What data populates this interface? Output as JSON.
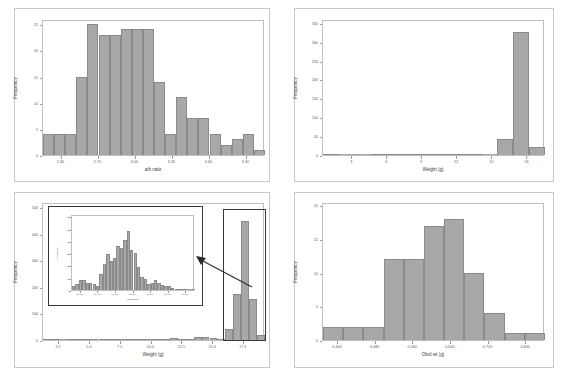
{
  "figure": {
    "background": "#ffffff",
    "bar_fill": "#a8a8a8",
    "bar_edge": "#8a8a8a",
    "frame_color": "#c9c9c9"
  },
  "chart_data": [
    {
      "panel": "top-left",
      "type": "bar",
      "title": "",
      "xlabel": "a/b ratio",
      "ylabel": "Frequency",
      "xlim": [
        2.25,
        4.05
      ],
      "ylim": [
        0,
        26
      ],
      "xticks": [
        "2.40",
        "2.70",
        "3.00",
        "3.30",
        "3.60",
        "3.90"
      ],
      "xtickvals": [
        2.4,
        2.7,
        3.0,
        3.3,
        3.6,
        3.9
      ],
      "yticks": [
        "0",
        "5",
        "10",
        "15",
        "20",
        "25"
      ],
      "ytickvals": [
        0,
        5,
        10,
        15,
        20,
        25
      ],
      "bin_width": 0.09,
      "bin_start": 2.28,
      "values": [
        4,
        4,
        4,
        15,
        25,
        23,
        23,
        24,
        24,
        24,
        14,
        4,
        11,
        7,
        7,
        4,
        2,
        3,
        4,
        1
      ],
      "grid": false,
      "legend": "none"
    },
    {
      "panel": "top-right",
      "type": "bar",
      "title": "",
      "xlabel": "Weight (g)",
      "ylabel": "Frequency",
      "xlim": [
        0.5,
        19.5
      ],
      "ylim": [
        0,
        360
      ],
      "xticks": [
        "3",
        "6",
        "9",
        "12",
        "15",
        "18"
      ],
      "xtickvals": [
        3,
        6,
        9,
        12,
        15,
        18
      ],
      "yticks": [
        "0",
        "50",
        "100",
        "150",
        "200",
        "250",
        "300",
        "350"
      ],
      "ytickvals": [
        0,
        50,
        100,
        150,
        200,
        250,
        300,
        350
      ],
      "bin_width": 1.5,
      "bin_start": 0.75,
      "values": [
        1,
        0,
        0,
        1,
        1,
        1,
        2,
        4,
        1,
        1,
        0,
        43,
        325,
        22
      ],
      "grid": false,
      "legend": "none"
    },
    {
      "panel": "bottom-left",
      "type": "bar",
      "title": "",
      "xlabel": "Weight (g)",
      "ylabel": "Frequency",
      "xlim": [
        1.2,
        19.2
      ],
      "ylim": [
        0,
        520
      ],
      "xticks": [
        "2.5",
        "5.0",
        "7.5",
        "10.0",
        "12.5",
        "15.0",
        "17.5"
      ],
      "xtickvals": [
        2.5,
        5.0,
        7.5,
        10.0,
        12.5,
        15.0,
        17.5
      ],
      "yticks": [
        "0",
        "100",
        "200",
        "300",
        "400",
        "500"
      ],
      "ytickvals": [
        0,
        100,
        200,
        300,
        400,
        500
      ],
      "bin_width": 0.6,
      "bin_start": 1.5,
      "values": [
        2,
        1,
        0,
        1,
        2,
        1,
        1,
        2,
        3,
        4,
        4,
        3,
        3,
        4,
        4,
        5,
        6,
        5,
        4,
        12,
        10,
        6,
        4,
        40,
        175,
        450,
        155,
        20
      ],
      "grid": false,
      "legend": "none",
      "annotation": "inset zoom of peak region",
      "inset": {
        "type": "bar",
        "xlabel": "Weight (g)",
        "ylabel": "Frequency",
        "xticks": [
          "15.000",
          "16.000",
          "16.500",
          "17.000",
          "17.500",
          "18.000",
          "18.500"
        ],
        "yticks": [
          "0",
          "10",
          "20",
          "30",
          "40",
          "50",
          "60"
        ],
        "ylim": [
          0,
          62
        ],
        "values": [
          3,
          5,
          8,
          8,
          6,
          6,
          5,
          3,
          13,
          21,
          29,
          24,
          26,
          36,
          34,
          41,
          48,
          33,
          30,
          19,
          11,
          9,
          5,
          6,
          8,
          6,
          4,
          3,
          3,
          2,
          1,
          1,
          1,
          0,
          0,
          1
        ]
      }
    },
    {
      "panel": "bottom-right",
      "type": "bar",
      "title": "",
      "xlabel": "Obol wt (g)",
      "ylabel": "Frequency",
      "xlim": [
        0.368,
        0.84
      ],
      "ylim": [
        0,
        20.5
      ],
      "xticks": [
        "0.400",
        "0.480",
        "0.560",
        "0.640",
        "0.720",
        "0.800"
      ],
      "xtickvals": [
        0.4,
        0.48,
        0.56,
        0.64,
        0.72,
        0.8
      ],
      "yticks": [
        "0",
        "5",
        "10",
        "15",
        "20"
      ],
      "ytickvals": [
        0,
        5,
        10,
        15,
        20
      ],
      "bin_width": 0.04,
      "bin_start": 0.38,
      "values": [
        2,
        2,
        2,
        12,
        12,
        17,
        18,
        10,
        4,
        1,
        1
      ],
      "grid": false,
      "legend": "none"
    }
  ]
}
